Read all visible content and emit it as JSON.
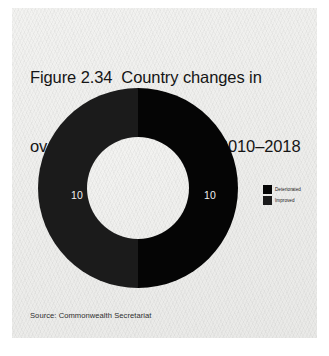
{
  "figure": {
    "title_line1": "Figure 2.34  Country changes in",
    "title_line2": "overall YDI score, MENA, 2010–2018",
    "source": "Source: Commonwealth Secretariat"
  },
  "legend": {
    "items": [
      {
        "label": "Deteriorated",
        "color": "#050505"
      },
      {
        "label": "Improved",
        "color": "#1b1b1b"
      }
    ]
  },
  "chart_data": {
    "type": "pie",
    "variant": "donut",
    "title": "Figure 2.34  Country changes in overall YDI score, MENA, 2010–2018",
    "subtitle": "",
    "xlabel": "",
    "ylabel": "",
    "categories": [
      "Deteriorated",
      "Improved"
    ],
    "values": [
      10,
      10
    ],
    "data_labels": [
      "10",
      "10"
    ],
    "percentages": [
      50,
      50
    ],
    "total": 20,
    "colors": [
      "#050505",
      "#1b1b1b"
    ],
    "data_label_color": "#f0f0f0",
    "start_angle_deg": 0,
    "direction": "clockwise",
    "inner_radius_ratio": 0.51,
    "legend": true,
    "legend_position": "right",
    "grid": false,
    "background_color": "#eeeeec",
    "source": "Source: Commonwealth Secretariat"
  }
}
